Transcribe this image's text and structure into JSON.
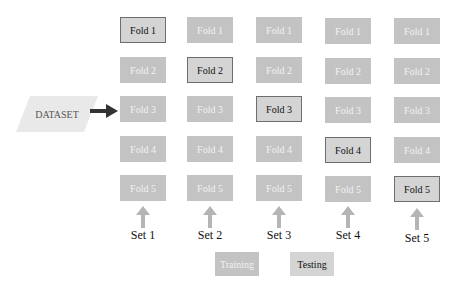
{
  "diagram": {
    "dataset_label": "DATASET",
    "columns": [
      {
        "set_label": "Set 1",
        "folds": [
          "Fold 1",
          "Fold 2",
          "Fold 3",
          "Fold 4",
          "Fold 5"
        ],
        "test_index": 0
      },
      {
        "set_label": "Set 2",
        "folds": [
          "Fold 1",
          "Fold 2",
          "Fold 3",
          "Fold 4",
          "Fold 5"
        ],
        "test_index": 1
      },
      {
        "set_label": "Set 3",
        "folds": [
          "Fold 1",
          "Fold 2",
          "Fold 3",
          "Fold 4",
          "Fold 5"
        ],
        "test_index": 2
      },
      {
        "set_label": "Set 4",
        "folds": [
          "Fold 1",
          "Fold 2",
          "Fold 3",
          "Fold 4",
          "Fold 5"
        ],
        "test_index": 3
      },
      {
        "set_label": "Set 5",
        "folds": [
          "Fold 1",
          "Fold 2",
          "Fold 3",
          "Fold 4",
          "Fold 5"
        ],
        "test_index": 4
      }
    ],
    "legend": {
      "training": "Training",
      "testing": "Testing"
    },
    "colors": {
      "training": "#c3c3c3",
      "testing": "#d4d4d4",
      "test_border": "#6e6e6e",
      "dataset": "#e9e9e9",
      "arrow": "#333333",
      "set_arrow": "#b5b5b5"
    }
  }
}
